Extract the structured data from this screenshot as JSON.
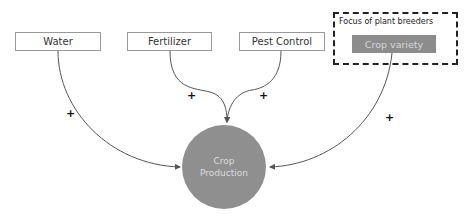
{
  "diagram": {
    "inputs": [
      {
        "label": "Water",
        "sign": "+"
      },
      {
        "label": "Fertilizer",
        "sign": "+"
      },
      {
        "label": "Pest Control",
        "sign": "+"
      },
      {
        "label": "Crop variety",
        "sign": "+"
      }
    ],
    "focus_group_label": "Focus of plant breeders",
    "output": {
      "line1": "Crop",
      "line2": "Production"
    },
    "colors": {
      "node_fill": "#8f8f8f",
      "edge": "#555555",
      "box_border": "#999999"
    }
  }
}
